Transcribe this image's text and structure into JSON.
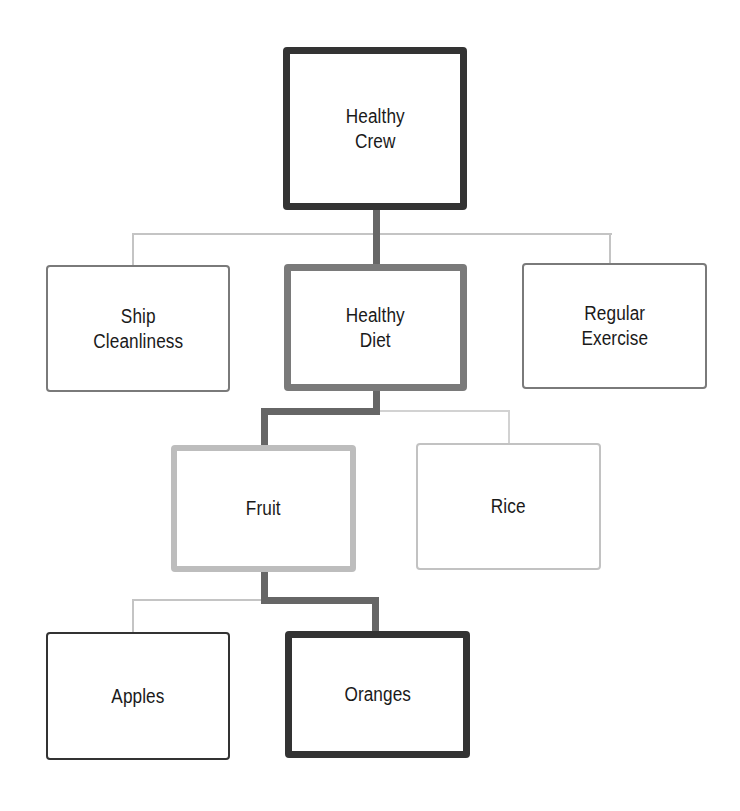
{
  "diagram": {
    "type": "hierarchy-tree",
    "root": "Healthy Crew",
    "nodes": {
      "healthy_crew": {
        "label": "Healthy\nCrew",
        "level": 0,
        "emphasis": "dark-thick"
      },
      "ship_cleanliness": {
        "label": "Ship\nCleanliness",
        "level": 1,
        "parent": "healthy_crew",
        "emphasis": "mid-thin"
      },
      "healthy_diet": {
        "label": "Healthy\nDiet",
        "level": 1,
        "parent": "healthy_crew",
        "emphasis": "mid-thick"
      },
      "regular_exercise": {
        "label": "Regular\nExercise",
        "level": 1,
        "parent": "healthy_crew",
        "emphasis": "mid-thin"
      },
      "fruit": {
        "label": "Fruit",
        "level": 2,
        "parent": "healthy_diet",
        "emphasis": "light-thick"
      },
      "rice": {
        "label": "Rice",
        "level": 2,
        "parent": "healthy_diet",
        "emphasis": "light-thin"
      },
      "apples": {
        "label": "Apples",
        "level": 3,
        "parent": "fruit",
        "emphasis": "dark-thin"
      },
      "oranges": {
        "label": "Oranges",
        "level": 3,
        "parent": "fruit",
        "emphasis": "dark-thick"
      }
    },
    "highlighted_path": [
      "Healthy Crew",
      "Healthy Diet",
      "Fruit",
      "Oranges"
    ],
    "colors": {
      "dark": "#333333",
      "mid": "#7a7a7a",
      "light": "#bdbdbd",
      "path_connector": "#666666",
      "thin_connector": "#c4c4c4",
      "text": "#1a1a1a",
      "background": "#ffffff"
    }
  }
}
